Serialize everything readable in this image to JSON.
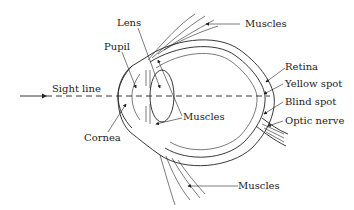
{
  "figure": {
    "type": "anatomical-diagram",
    "line_color": "#222222",
    "background": "#ffffff"
  },
  "labels": {
    "lens": "Lens",
    "pupil": "Pupil",
    "sight_line": "Sight line",
    "cornea": "Cornea",
    "muscles_inner": "Muscles",
    "muscles_top": "Muscles",
    "muscles_bottom": "Muscles",
    "retina": "Retina",
    "yellow_spot": "Yellow spot",
    "blind_spot": "Blind spot",
    "optic_nerve": "Optic nerve"
  }
}
